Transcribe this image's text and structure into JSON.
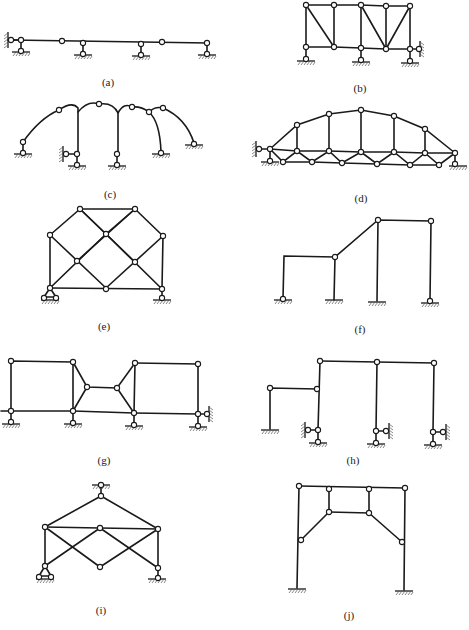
{
  "figure": {
    "panels": [
      {
        "id": "a",
        "label": "(a)",
        "type": "multi-span hinged beam on supports"
      },
      {
        "id": "b",
        "label": "(b)",
        "type": "truss on three supports with side link"
      },
      {
        "id": "c",
        "label": "(c)",
        "type": "series of curved hinged arches"
      },
      {
        "id": "d",
        "label": "(d)",
        "type": "arched truss bridge"
      },
      {
        "id": "e",
        "label": "(e)",
        "type": "diamond-lattice truss"
      },
      {
        "id": "f",
        "label": "(f)",
        "type": "stepped frame"
      },
      {
        "id": "g",
        "label": "(g)",
        "type": "two rectangular frames joined by link chain"
      },
      {
        "id": "h",
        "label": "(h)",
        "type": "multi-bay frame with link supports"
      },
      {
        "id": "i",
        "label": "(i)",
        "type": "crossed-bar truss hung from top support"
      },
      {
        "id": "j",
        "label": "(j)",
        "type": "portal frame with internal hinged chain"
      }
    ]
  },
  "colors": {
    "line": "#1a1a1a",
    "background": "#ffffff"
  }
}
